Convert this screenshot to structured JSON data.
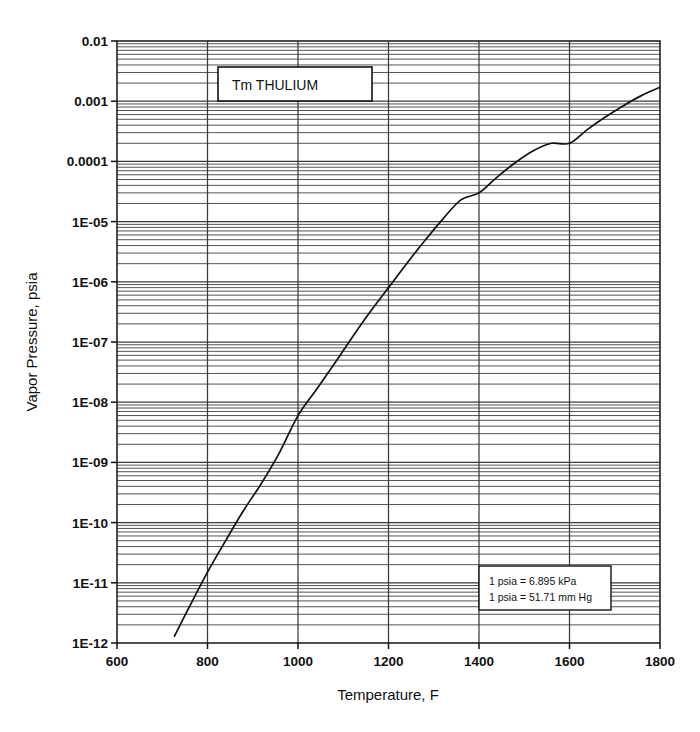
{
  "chart_data": {
    "type": "line",
    "title": "Tm   THULIUM",
    "element_symbol": "Tm",
    "element_name": "THULIUM",
    "xlabel": "Temperature, F",
    "ylabel": "Vapor Pressure, psia",
    "xlim": [
      600,
      1800
    ],
    "ylim": [
      1e-12,
      0.01
    ],
    "yscale": "log",
    "xscale": "linear",
    "grid": true,
    "grid_minor": true,
    "legend": "none",
    "xticks": [
      600,
      800,
      1000,
      1200,
      1400,
      1600,
      1800
    ],
    "xticklabels": [
      "600",
      "800",
      "1000",
      "1200",
      "1400",
      "1600",
      "1800"
    ],
    "yticks": [
      0.01,
      0.001,
      0.0001,
      1e-05,
      1e-06,
      1e-07,
      1e-08,
      1e-09,
      1e-10,
      1e-11,
      1e-12
    ],
    "yticklabels": [
      "0.01",
      "0.001",
      "0.0001",
      "1E-05",
      "1E-06",
      "1E-07",
      "1E-08",
      "1E-09",
      "1E-10",
      "1E-11",
      "1E-12"
    ],
    "series": [
      {
        "name": "Thulium vapor pressure",
        "x": [
          727,
          760,
          800,
          840,
          880,
          920,
          960,
          1000,
          1040,
          1080,
          1120,
          1160,
          1200,
          1240,
          1280,
          1320,
          1360,
          1400,
          1440,
          1480,
          1520,
          1560,
          1600,
          1640,
          1680,
          1720,
          1760,
          1800
        ],
        "y": [
          1.3e-12,
          4e-12,
          1.5e-11,
          5e-11,
          1.6e-10,
          4.6e-10,
          1.5e-09,
          6e-09,
          1.6e-08,
          4.3e-08,
          1.2e-07,
          3.2e-07,
          8e-07,
          2e-06,
          4.8e-06,
          1.1e-05,
          2.3e-05,
          3e-05,
          5.5e-05,
          9.5e-05,
          0.00015,
          0.0002,
          0.0002,
          0.00034,
          0.00055,
          0.00085,
          0.00125,
          0.0017
        ],
        "color": "#111111"
      }
    ],
    "annotations": [
      {
        "name": "unit-conversion-note",
        "lines": [
          "1 psia = 6.895 kPa",
          "1 psia = 51.71 mm Hg"
        ]
      }
    ]
  },
  "note": {
    "line1": "1 psia = 6.895 kPa",
    "line2": "1 psia = 51.71 mm Hg"
  },
  "titlebox": {
    "label": "Tm   THULIUM"
  },
  "axes": {
    "x_label": "Temperature, F",
    "y_label": "Vapor Pressure, psia"
  },
  "colors": {
    "curve": "#111111",
    "grid_major": "#3a3a3a",
    "grid_minor": "#4a4a4a",
    "frame": "#222222",
    "background": "#ffffff"
  }
}
